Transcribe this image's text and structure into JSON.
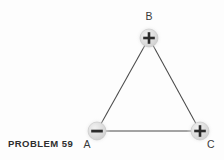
{
  "figure": {
    "caption": "PROBLEM 59",
    "background_color": "#fdfdfd",
    "line_color": "#4a4a4a",
    "node_fill_color": "#d9d9d9",
    "sign_color": "#2b2b2b",
    "label_color": "#3a3a3a",
    "nodes": [
      {
        "id": "A",
        "label": "A",
        "sign": "−",
        "sign_name": "minus-sign",
        "charge": "negative",
        "cx": 97,
        "cy": 131,
        "r": 9,
        "label_x": 87,
        "label_y": 148
      },
      {
        "id": "B",
        "label": "B",
        "sign": "+",
        "sign_name": "plus-sign",
        "charge": "positive",
        "cx": 149,
        "cy": 38,
        "r": 9,
        "label_x": 149,
        "label_y": 20
      },
      {
        "id": "C",
        "label": "C",
        "sign": "+",
        "sign_name": "plus-sign",
        "charge": "positive",
        "cx": 200,
        "cy": 131,
        "r": 9,
        "label_x": 211,
        "label_y": 148
      }
    ],
    "edges": [
      {
        "id": "AB",
        "from": "A",
        "to": "B",
        "x1": 97,
        "y1": 131,
        "x2": 149,
        "y2": 38
      },
      {
        "id": "BC",
        "from": "B",
        "to": "C",
        "x1": 149,
        "y1": 38,
        "x2": 200,
        "y2": 131
      },
      {
        "id": "AC",
        "from": "A",
        "to": "C",
        "x1": 97,
        "y1": 131,
        "x2": 200,
        "y2": 131
      }
    ],
    "caption_x": 8,
    "caption_y": 147
  }
}
